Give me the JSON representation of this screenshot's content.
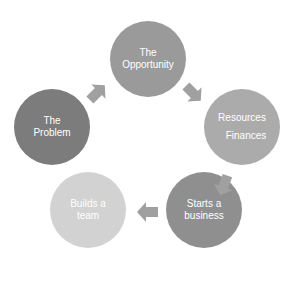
{
  "diagram": {
    "type": "cycle",
    "nodes": [
      {
        "id": "opportunity",
        "lines": [
          "The",
          "Opportunity"
        ],
        "color": "#9a9a9a"
      },
      {
        "id": "resources",
        "lines": [
          "Resources",
          "Finances"
        ],
        "color": "#ababab"
      },
      {
        "id": "starts",
        "lines": [
          "Starts a",
          "business"
        ],
        "color": "#8f8f8f"
      },
      {
        "id": "builds",
        "lines": [
          "Builds a",
          "team"
        ],
        "color": "#d2d2d2"
      },
      {
        "id": "problem",
        "lines": [
          "The",
          "Problem"
        ],
        "color": "#7c7c7c"
      }
    ],
    "edges": [
      {
        "from": "problem",
        "to": "opportunity"
      },
      {
        "from": "opportunity",
        "to": "resources"
      },
      {
        "from": "resources",
        "to": "starts"
      },
      {
        "from": "starts",
        "to": "builds"
      }
    ],
    "arrow_color": "#a0a0a0"
  }
}
